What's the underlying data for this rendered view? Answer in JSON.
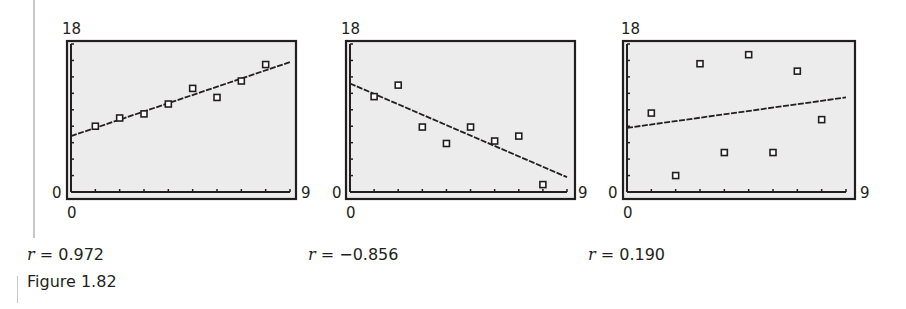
{
  "figure_caption": "Figure 1.82",
  "colors": {
    "plot_bg": "#ececec",
    "frame": "#231f20",
    "line": "#231f20",
    "marker": "#231f20"
  },
  "chart_data": [
    {
      "type": "scatter",
      "title": "",
      "xlabel": "",
      "ylabel": "",
      "xlim": [
        0,
        9
      ],
      "ylim": [
        0,
        18
      ],
      "x_tick_labels": {
        "min": "0",
        "max": "9"
      },
      "y_tick_labels": {
        "min": "0",
        "max": "18"
      },
      "x_ticks_every": 1,
      "y_ticks_every": 2,
      "x": [
        1,
        2,
        3,
        4,
        5,
        6,
        7,
        8
      ],
      "y": [
        8,
        9,
        9.5,
        10.7,
        12.6,
        11.5,
        13.5,
        15.5
      ],
      "fit_line": {
        "x": [
          0,
          9
        ],
        "y": [
          6.8,
          15.8
        ]
      },
      "annotation": "r = 0.972",
      "r_label": "r",
      "r_value": "= 0.972"
    },
    {
      "type": "scatter",
      "title": "",
      "xlabel": "",
      "ylabel": "",
      "xlim": [
        0,
        9
      ],
      "ylim": [
        0,
        18
      ],
      "x_tick_labels": {
        "min": "0",
        "max": "9"
      },
      "y_tick_labels": {
        "min": "0",
        "max": "18"
      },
      "x_ticks_every": 1,
      "y_ticks_every": 2,
      "x": [
        1,
        2,
        3,
        4,
        5,
        6,
        7,
        8
      ],
      "y": [
        11.6,
        13,
        7.9,
        5.9,
        7.9,
        6.2,
        6.8,
        0.9
      ],
      "fit_line": {
        "x": [
          0,
          9
        ],
        "y": [
          13.2,
          1.8
        ]
      },
      "annotation": "r = −0.856",
      "r_label": "r",
      "r_value": "= −0.856"
    },
    {
      "type": "scatter",
      "title": "",
      "xlabel": "",
      "ylabel": "",
      "xlim": [
        0,
        9
      ],
      "ylim": [
        0,
        18
      ],
      "x_tick_labels": {
        "min": "0",
        "max": "9"
      },
      "y_tick_labels": {
        "min": "0",
        "max": "18"
      },
      "x_ticks_every": 1,
      "y_ticks_every": 2,
      "x": [
        1,
        2,
        3,
        4,
        5,
        6,
        7,
        8
      ],
      "y": [
        9.6,
        2,
        15.6,
        4.8,
        16.7,
        4.8,
        14.7,
        8.8
      ],
      "fit_line": {
        "x": [
          0,
          9
        ],
        "y": [
          7.8,
          11.5
        ]
      },
      "annotation": "r = 0.190",
      "r_label": "r",
      "r_value": "= 0.190"
    }
  ]
}
